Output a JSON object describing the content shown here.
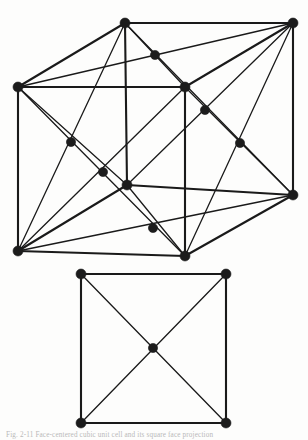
{
  "figure": {
    "caption": "Fig. 2-11   Face-centered cubic unit cell and its square face projection",
    "caption_label": "Fig. 2-11",
    "stroke_color": "#1a1a1a",
    "node_color": "#1c1c1c",
    "background_color": "#fdfdfc",
    "line_width_thick": 2.1,
    "line_width_thin": 1.3,
    "node_radius": 5.0,
    "node_radius_small": 4.6
  },
  "diagrams": [
    {
      "name": "face-centered-cubic-cell",
      "type": "3d-cube-perspective",
      "label": "upper",
      "vertices": [
        {
          "id": "back-top-left",
          "x": 125,
          "y": 23,
          "kind": "corner"
        },
        {
          "id": "back-top-right",
          "x": 293,
          "y": 23,
          "kind": "corner"
        },
        {
          "id": "front-top-left",
          "x": 18,
          "y": 87,
          "kind": "corner"
        },
        {
          "id": "front-top-right",
          "x": 185,
          "y": 87,
          "kind": "corner"
        },
        {
          "id": "back-bottom-right",
          "x": 293,
          "y": 195,
          "kind": "corner"
        },
        {
          "id": "front-bottom-left",
          "x": 18,
          "y": 251,
          "kind": "corner"
        },
        {
          "id": "front-bottom-right",
          "x": 185,
          "y": 256,
          "kind": "corner"
        },
        {
          "id": "back-bottom-left",
          "x": 127,
          "y": 185,
          "kind": "corner"
        }
      ],
      "face_centers": [
        {
          "id": "top-face-center",
          "x": 155,
          "y": 55,
          "kind": "face-center"
        },
        {
          "id": "right-face-center",
          "x": 240,
          "y": 143,
          "kind": "face-center"
        },
        {
          "id": "back-face-center",
          "x": 205,
          "y": 110,
          "kind": "face-center"
        },
        {
          "id": "left-face-center",
          "x": 71,
          "y": 142,
          "kind": "face-center"
        },
        {
          "id": "front-face-center",
          "x": 103,
          "y": 172,
          "kind": "face-center"
        },
        {
          "id": "bottom-face-center",
          "x": 153,
          "y": 228,
          "kind": "face-center"
        }
      ],
      "edges": [
        {
          "from": "back-top-left",
          "to": "back-top-right",
          "weight": "thick"
        },
        {
          "from": "back-top-left",
          "to": "front-top-left",
          "weight": "thick"
        },
        {
          "from": "back-top-right",
          "to": "front-top-right",
          "weight": "thick"
        },
        {
          "from": "front-top-left",
          "to": "front-top-right",
          "weight": "thick"
        },
        {
          "from": "front-top-left",
          "to": "front-bottom-left",
          "weight": "thick"
        },
        {
          "from": "back-top-right",
          "to": "back-bottom-right",
          "weight": "thick"
        },
        {
          "from": "front-top-right",
          "to": "front-bottom-right",
          "weight": "thick"
        },
        {
          "from": "back-top-left",
          "to": "back-bottom-left",
          "weight": "thick"
        },
        {
          "from": "front-bottom-left",
          "to": "front-bottom-right",
          "weight": "thick"
        },
        {
          "from": "front-bottom-right",
          "to": "back-bottom-right",
          "weight": "thick"
        },
        {
          "from": "front-bottom-left",
          "to": "back-bottom-left",
          "weight": "thick"
        },
        {
          "from": "back-bottom-left",
          "to": "back-bottom-right",
          "weight": "thick"
        }
      ],
      "diagonals": [
        {
          "from": "back-top-left",
          "to": "front-top-right",
          "through": "top-face-center"
        },
        {
          "from": "back-top-right",
          "to": "front-top-left",
          "through": "top-face-center"
        },
        {
          "from": "back-top-right",
          "to": "back-bottom-left",
          "through": "back-face-center"
        },
        {
          "from": "back-top-left",
          "to": "back-bottom-right",
          "through": "back-face-center"
        },
        {
          "from": "back-top-right",
          "to": "front-bottom-right",
          "through": "right-face-center"
        },
        {
          "from": "front-top-right",
          "to": "back-bottom-right",
          "through": "right-face-center"
        },
        {
          "from": "front-top-left",
          "to": "back-bottom-left",
          "through": "left-face-center"
        },
        {
          "from": "back-top-left",
          "to": "front-bottom-left",
          "through": "left-face-center"
        },
        {
          "from": "front-top-left",
          "to": "front-bottom-right",
          "through": "front-face-center"
        },
        {
          "from": "front-top-right",
          "to": "front-bottom-left",
          "through": "front-face-center"
        },
        {
          "from": "front-bottom-left",
          "to": "back-bottom-right",
          "through": "bottom-face-center"
        },
        {
          "from": "back-bottom-left",
          "to": "front-bottom-right",
          "through": "bottom-face-center"
        }
      ],
      "counts": {
        "corner_atoms": 8,
        "face_center_atoms": 6,
        "total_drawn_nodes": 14
      }
    },
    {
      "name": "square-face-projection",
      "type": "2d-square",
      "label": "lower",
      "vertices": [
        {
          "id": "sq-top-left",
          "x": 81,
          "y": 274,
          "kind": "corner"
        },
        {
          "id": "sq-top-right",
          "x": 226,
          "y": 274,
          "kind": "corner"
        },
        {
          "id": "sq-bottom-left",
          "x": 81,
          "y": 423,
          "kind": "corner"
        },
        {
          "id": "sq-bottom-right",
          "x": 226,
          "y": 423,
          "kind": "corner"
        }
      ],
      "face_centers": [
        {
          "id": "sq-center",
          "x": 153,
          "y": 348,
          "kind": "face-center"
        }
      ],
      "edges": [
        {
          "from": "sq-top-left",
          "to": "sq-top-right",
          "weight": "thick"
        },
        {
          "from": "sq-top-right",
          "to": "sq-bottom-right",
          "weight": "thick"
        },
        {
          "from": "sq-bottom-right",
          "to": "sq-bottom-left",
          "weight": "thick"
        },
        {
          "from": "sq-bottom-left",
          "to": "sq-top-left",
          "weight": "thick"
        }
      ],
      "diagonals": [
        {
          "from": "sq-top-left",
          "to": "sq-bottom-right",
          "through": "sq-center"
        },
        {
          "from": "sq-top-right",
          "to": "sq-bottom-left",
          "through": "sq-center"
        }
      ],
      "counts": {
        "corner_atoms": 4,
        "face_center_atoms": 1,
        "total_drawn_nodes": 5
      }
    }
  ]
}
